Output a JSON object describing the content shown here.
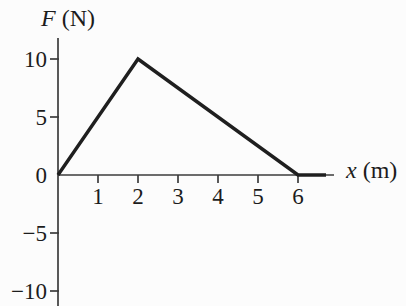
{
  "figure": {
    "background": "#fcfcfc",
    "line_color": "#1f1f1f",
    "axis_color": "#3c3c3c",
    "text_color": "#1c1c1c"
  },
  "chart_data": {
    "type": "line",
    "title": "",
    "ylabel_variable": "F",
    "ylabel_unit": "(N)",
    "xlabel_variable": "x",
    "xlabel_unit": "(m)",
    "x": [
      0,
      2,
      6,
      6.7
    ],
    "y": [
      0,
      10,
      0,
      0
    ],
    "xticks": [
      1,
      2,
      3,
      4,
      5,
      6
    ],
    "yticks": [
      10,
      5,
      0,
      -5,
      -10
    ],
    "xlim": [
      0,
      6.9
    ],
    "ylim": [
      -11.3,
      11.8
    ],
    "grid": false,
    "legend_position": "none"
  }
}
